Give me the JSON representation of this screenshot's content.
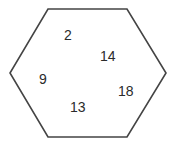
{
  "figure": {
    "type": "hexagon-with-numbers",
    "background_color": "#ffffff",
    "shape": {
      "name": "hexagon",
      "sides": 6,
      "stroke_color": "#444444",
      "stroke_width": 1.6,
      "fill_color": "none",
      "vertices": [
        {
          "x": 48,
          "y": 9
        },
        {
          "x": 127,
          "y": 9
        },
        {
          "x": 166,
          "y": 73
        },
        {
          "x": 127,
          "y": 137
        },
        {
          "x": 48,
          "y": 137
        },
        {
          "x": 10,
          "y": 73
        }
      ]
    },
    "numbers": [
      {
        "value": "2",
        "x": 64,
        "y": 28
      },
      {
        "value": "14",
        "x": 100,
        "y": 49
      },
      {
        "value": "9",
        "x": 39,
        "y": 72
      },
      {
        "value": "18",
        "x": 118,
        "y": 84
      },
      {
        "value": "13",
        "x": 70,
        "y": 100
      }
    ]
  }
}
